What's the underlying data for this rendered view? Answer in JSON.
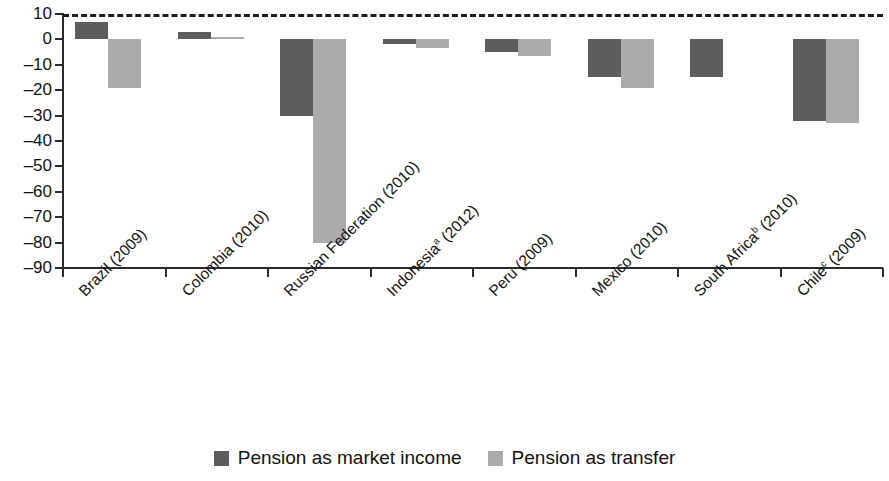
{
  "chart_data": {
    "type": "bar",
    "title": "",
    "subtitle": "",
    "xlabel": "",
    "ylabel": "",
    "ylim": [
      -90,
      10
    ],
    "ytick_step": 10,
    "yticks": [
      10,
      0,
      -10,
      -20,
      -30,
      -40,
      -50,
      -60,
      -70,
      -80,
      -90
    ],
    "ytick_labels": [
      "10",
      "0",
      "–10",
      "–20",
      "–30",
      "–40",
      "–50",
      "–60",
      "–70",
      "–80",
      "–90"
    ],
    "grid": false,
    "zero_line": true,
    "legend_position": "bottom-center",
    "categories": [
      "Brazil (2009)",
      "Colombia (2010)",
      "Russian Federation (2010)",
      "Indonesiaᵃ (2012)",
      "Peru (2009)",
      "Mexico (2010)",
      "South Africaᵇ (2010)",
      "Chileᶜ (2009)"
    ],
    "category_parts": [
      {
        "name": "Brazil",
        "note": "",
        "year": "(2009)"
      },
      {
        "name": "Colombia",
        "note": "",
        "year": "(2010)"
      },
      {
        "name": "Russian Federation",
        "note": "",
        "year": "(2010)"
      },
      {
        "name": "Indonesia",
        "note": "a",
        "year": "(2012)"
      },
      {
        "name": "Peru",
        "note": "",
        "year": "(2009)"
      },
      {
        "name": "Mexico",
        "note": "",
        "year": "(2010)"
      },
      {
        "name": "South Africa",
        "note": "b",
        "year": "(2010)"
      },
      {
        "name": "Chile",
        "note": "c",
        "year": "(2009)"
      }
    ],
    "series": [
      {
        "name": "Pension as market income",
        "color": "#5d5d5d",
        "values": [
          7,
          3,
          -30,
          -2,
          -5,
          -15,
          -15,
          -32
        ]
      },
      {
        "name": "Pension as transfer",
        "color": "#ababab",
        "values": [
          -19,
          1,
          -80,
          -3.5,
          -6.5,
          -19,
          null,
          -33
        ]
      }
    ]
  },
  "legend": {
    "items": [
      {
        "label": "Pension as market income",
        "swatch": "dark"
      },
      {
        "label": "Pension as transfer",
        "swatch": "light"
      }
    ]
  }
}
